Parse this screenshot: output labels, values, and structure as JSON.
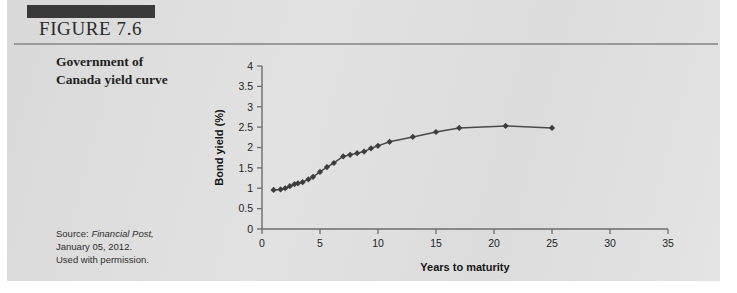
{
  "figure": {
    "label": "FIGURE 7.6",
    "caption_line1": "Government of",
    "caption_line2": "Canada yield curve",
    "source_prefix": "Source:",
    "source_publication": "Financial Post,",
    "source_date": "January 05, 2012.",
    "source_permission": "Used with permission."
  },
  "colors": {
    "panel": "#dedede",
    "header_bar": "#3a3a3a",
    "rule": "#9a9a9a",
    "axis": "#6d6d6d",
    "series": "#3d3d3d"
  },
  "chart_data": {
    "type": "line",
    "title": "",
    "subtitle": "",
    "xlabel": "Years to maturity",
    "ylabel": "Bond yield (%)",
    "xlim": [
      0,
      35
    ],
    "ylim": [
      0,
      4
    ],
    "xticks": [
      0,
      5,
      10,
      15,
      20,
      25,
      30,
      35
    ],
    "yticks": [
      0,
      0.5,
      1,
      1.5,
      2,
      2.5,
      3,
      3.5,
      4
    ],
    "xtick_labels": [
      "0",
      "5",
      "10",
      "15",
      "20",
      "25",
      "30",
      "35"
    ],
    "ytick_labels": [
      "0",
      "0.5",
      "1",
      "1.5",
      "2",
      "2.5",
      "3",
      "3.5",
      "4"
    ],
    "grid": false,
    "legend": "none",
    "marker": "diamond",
    "series": [
      {
        "name": "Government of Canada yield curve",
        "x": [
          1.0,
          1.6,
          2.0,
          2.4,
          2.8,
          3.1,
          3.5,
          4.0,
          4.4,
          5.0,
          5.6,
          6.2,
          7.0,
          7.6,
          8.2,
          8.8,
          9.4,
          10.0,
          11.0,
          13.0,
          15.0,
          17.0,
          21.0,
          25.0
        ],
        "y": [
          0.96,
          0.97,
          1.0,
          1.05,
          1.1,
          1.12,
          1.15,
          1.22,
          1.28,
          1.4,
          1.52,
          1.62,
          1.78,
          1.82,
          1.86,
          1.9,
          1.98,
          2.04,
          2.14,
          2.26,
          2.38,
          2.48,
          2.53,
          2.48
        ]
      }
    ]
  }
}
